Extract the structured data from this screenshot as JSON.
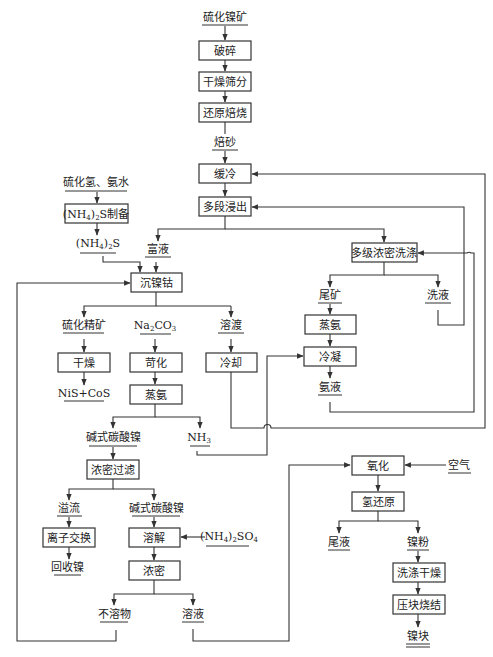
{
  "diagram": {
    "title": "",
    "main_chain": {
      "input": "硫化镍矿",
      "crush": "破碎",
      "dry_screen": "干燥筛分",
      "reduce_roast": "还原焙烧",
      "calcine": "焙砂",
      "slow_cool": "缓冷",
      "multi_leach": "多段浸出"
    },
    "ammonium_sulfide": {
      "input": "硫化氢、氨水",
      "prep_box": "(NH4)2S制备",
      "prep_main": "(NH",
      "prep_sub4": "4",
      "prep_close": ")",
      "prep_sub2": "2",
      "prep_tail": "S制备",
      "product_main": "(NH",
      "product_sub4": "4",
      "product_close": ")",
      "product_sub2": "2",
      "product_tail": "S"
    },
    "rich_liquor": "富液",
    "precipitate": "沉镍钴",
    "washing": {
      "box": "多级浓密洗涤",
      "tailings": "尾矿",
      "wash_liquor": "洗液",
      "ammonia_still": "蒸氨",
      "condense": "冷凝",
      "ammonia_liquor": "氨液"
    },
    "sulfide_branch": {
      "concentrate": "硫化精矿",
      "dry": "干燥",
      "product": "NiS+CoS"
    },
    "carbonate_branch": {
      "reagent_main": "Na",
      "reagent_sub2": "2",
      "reagent_mid": "CO",
      "reagent_sub3": "3",
      "causticize": "苛化",
      "ammonia_still": "蒸氨",
      "basic_nickel_carbonate": "碱式碳酸镍",
      "nh3_main": "NH",
      "nh3_sub": "3",
      "thicken_filter": "浓密过滤",
      "overflow": "溢流",
      "ion_exchange": "离子交换",
      "recovered_nickel": "回收镍",
      "basic_nickel_carbonate_2": "碱式碳酸镍",
      "dissolve": "溶解",
      "ammonium_sulfate_main": "(NH",
      "ammonium_sulfate_sub4": "4",
      "ammonium_sulfate_close": ")",
      "ammonium_sulfate_sub2": "2",
      "ammonium_sulfate_tail": "SO",
      "ammonium_sulfate_sub4b": "4",
      "thicken": "浓密",
      "insoluble": "不溶物",
      "solution": "溶液"
    },
    "residue_branch": {
      "residue": "溶渡",
      "cool": "冷却"
    },
    "reduction_branch": {
      "oxidize": "氧化",
      "air": "空气",
      "hydrogen_reduce": "氢还原",
      "tail_liquor": "尾液",
      "nickel_powder": "镍粉",
      "wash_dry": "洗涤干燥",
      "press_sinter": "压块烧结",
      "nickel_block": "镍块"
    }
  }
}
